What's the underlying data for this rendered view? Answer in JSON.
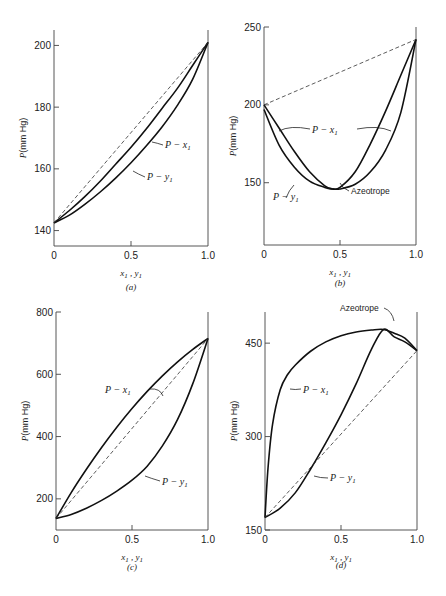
{
  "figure": {
    "panels": [
      {
        "id": "a",
        "caption": "(a)",
        "xlabel": "x1 , y1",
        "ylabel": "P(mm Hg)"
      },
      {
        "id": "b",
        "caption": "(b)",
        "xlabel": "x1 , y1",
        "ylabel": "P(mm Hg)"
      },
      {
        "id": "c",
        "caption": "(c)",
        "xlabel": "x1 , y1",
        "ylabel": "P(mm Hg)"
      },
      {
        "id": "d",
        "caption": "(d)",
        "xlabel": "x1 , y1",
        "ylabel": "P(mm Hg)"
      }
    ]
  },
  "chart_data": [
    {
      "panel": "a",
      "type": "line",
      "title": "",
      "caption": "(a)",
      "xlabel": "x1 , y1",
      "ylabel": "P(mm Hg)",
      "xlim": [
        0,
        1
      ],
      "ylim": [
        135,
        205
      ],
      "xticks": [
        0,
        0.5,
        1.0
      ],
      "xtick_labels": [
        "0",
        "0.5",
        "1.0"
      ],
      "yticks": [
        140,
        160,
        180,
        200
      ],
      "ytick_labels": [
        "140",
        "160",
        "180",
        "200"
      ],
      "grid": false,
      "series": [
        {
          "name": "P - x1",
          "x": [
            0,
            0.1,
            0.2,
            0.3,
            0.4,
            0.5,
            0.6,
            0.7,
            0.8,
            0.9,
            1.0
          ],
          "y": [
            142.5,
            146.5,
            151,
            156,
            161.5,
            167,
            173,
            179.5,
            186,
            193.5,
            201
          ]
        },
        {
          "name": "P - y1",
          "x": [
            0,
            0.1,
            0.2,
            0.3,
            0.4,
            0.5,
            0.6,
            0.7,
            0.8,
            0.9,
            1.0
          ],
          "y": [
            142.5,
            145,
            148.5,
            152.5,
            157,
            162,
            167.5,
            173.5,
            180.5,
            189,
            201
          ]
        },
        {
          "name": "Raoult line",
          "style": "dashed",
          "x": [
            0,
            1
          ],
          "y": [
            142.5,
            201
          ]
        }
      ],
      "annotations": [
        {
          "text": "P - x1"
        },
        {
          "text": "P - y1"
        }
      ]
    },
    {
      "panel": "b",
      "type": "line",
      "title": "",
      "caption": "(b)",
      "xlabel": "x1 , y1",
      "ylabel": "P(mm Hg)",
      "xlim": [
        0,
        1
      ],
      "ylim": [
        110,
        250
      ],
      "xticks": [
        0,
        0.5,
        1.0
      ],
      "xtick_labels": [
        "0",
        "0.5",
        "1.0"
      ],
      "yticks": [
        150,
        200,
        250
      ],
      "ytick_labels": [
        "150",
        "200",
        "250"
      ],
      "grid": false,
      "series": [
        {
          "name": "P - x1",
          "x": [
            0,
            0.1,
            0.2,
            0.3,
            0.4,
            0.45,
            0.5,
            0.6,
            0.7,
            0.8,
            0.9,
            1.0
          ],
          "y": [
            200,
            185,
            170,
            157,
            148,
            146,
            147,
            157,
            175,
            196,
            219,
            242
          ]
        },
        {
          "name": "P - y1",
          "x": [
            0,
            0.1,
            0.2,
            0.3,
            0.4,
            0.45,
            0.5,
            0.6,
            0.7,
            0.8,
            0.9,
            1.0
          ],
          "y": [
            197,
            174,
            160,
            151,
            147,
            146,
            146,
            149,
            157,
            171,
            195,
            242
          ]
        },
        {
          "name": "Raoult line",
          "style": "dashed",
          "x": [
            0,
            1
          ],
          "y": [
            200,
            242
          ]
        }
      ],
      "annotations": [
        {
          "text": "P - x1"
        },
        {
          "text": "P - y1"
        },
        {
          "text": "Azeotrope",
          "x": 0.45,
          "y": 146
        }
      ]
    },
    {
      "panel": "c",
      "type": "line",
      "title": "",
      "caption": "(c)",
      "xlabel": "x1 , y1",
      "ylabel": "P(mm Hg)",
      "xlim": [
        0,
        1
      ],
      "ylim": [
        100,
        800
      ],
      "xticks": [
        0,
        0.5,
        1.0
      ],
      "xtick_labels": [
        "0",
        "0.5",
        "1.0"
      ],
      "yticks": [
        200,
        400,
        600,
        800
      ],
      "ytick_labels": [
        "200",
        "400",
        "600",
        "800"
      ],
      "grid": false,
      "series": [
        {
          "name": "P - x1",
          "x": [
            0,
            0.1,
            0.2,
            0.3,
            0.4,
            0.5,
            0.6,
            0.7,
            0.8,
            0.9,
            1.0
          ],
          "y": [
            137,
            220,
            295,
            365,
            430,
            490,
            545,
            595,
            640,
            680,
            715
          ]
        },
        {
          "name": "P - y1",
          "x": [
            0,
            0.1,
            0.2,
            0.3,
            0.4,
            0.5,
            0.6,
            0.7,
            0.8,
            0.9,
            1.0
          ],
          "y": [
            137,
            150,
            170,
            195,
            225,
            260,
            305,
            370,
            455,
            570,
            715
          ]
        },
        {
          "name": "Raoult line",
          "style": "dashed",
          "x": [
            0,
            1
          ],
          "y": [
            137,
            715
          ]
        }
      ],
      "annotations": [
        {
          "text": "P - x1"
        },
        {
          "text": "P - y1"
        }
      ]
    },
    {
      "panel": "d",
      "type": "line",
      "title": "",
      "caption": "(d)",
      "xlabel": "x1 , y1",
      "ylabel": "P(mm Hg)",
      "xlim": [
        0,
        1
      ],
      "ylim": [
        150,
        500
      ],
      "xticks": [
        0,
        0.5,
        1.0
      ],
      "xtick_labels": [
        "0",
        "0.5",
        "1.0"
      ],
      "yticks": [
        150,
        300,
        450
      ],
      "ytick_labels": [
        "150",
        "300",
        "450"
      ],
      "grid": false,
      "series": [
        {
          "name": "P - x1",
          "x": [
            0,
            0.02,
            0.05,
            0.1,
            0.15,
            0.2,
            0.3,
            0.4,
            0.5,
            0.6,
            0.7,
            0.78,
            0.85,
            0.92,
            1.0
          ],
          "y": [
            170,
            250,
            320,
            375,
            400,
            415,
            437,
            452,
            462,
            468,
            471,
            472,
            466,
            458,
            438
          ]
        },
        {
          "name": "P - y1",
          "x": [
            0,
            0.1,
            0.2,
            0.3,
            0.4,
            0.5,
            0.6,
            0.7,
            0.78,
            0.85,
            0.92,
            1.0
          ],
          "y": [
            170,
            185,
            210,
            248,
            290,
            335,
            385,
            440,
            472,
            460,
            452,
            438
          ]
        },
        {
          "name": "Raoult line",
          "style": "dashed",
          "x": [
            0,
            1
          ],
          "y": [
            170,
            438
          ]
        }
      ],
      "annotations": [
        {
          "text": "P - x1"
        },
        {
          "text": "P - y1"
        },
        {
          "text": "Azeotrope",
          "x": 0.78,
          "y": 472
        }
      ]
    }
  ],
  "labels": {
    "a": {
      "px1": "P − x",
      "py1": "P − y",
      "sub": "1"
    },
    "b": {
      "px1": "P − x",
      "py1": "P − y",
      "azeo": "Azeotrope",
      "sub": "1"
    },
    "c": {
      "px1": "P − x",
      "py1": "P − y",
      "sub": "1"
    },
    "d": {
      "px1": "P − x",
      "py1": "P − y",
      "azeo": "Azeotrope",
      "sub": "1"
    }
  }
}
